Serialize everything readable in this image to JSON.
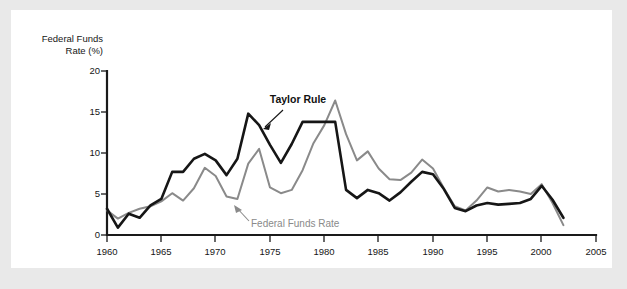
{
  "chart_data": {
    "type": "line",
    "title": "",
    "subtitle": "",
    "xlabel": "",
    "ylabel": "Federal Funds Rate (%)",
    "ylabel_line1": "Federal Funds",
    "ylabel_line2": "Rate (%)",
    "xlim": [
      1960,
      2005
    ],
    "ylim": [
      0,
      20
    ],
    "grid": false,
    "legend_position": "inline-annotations",
    "y_ticks": [
      0,
      5,
      10,
      15,
      20
    ],
    "y_tick_labels": [
      "0",
      "5",
      "10",
      "15",
      "20"
    ],
    "x_ticks": [
      1960,
      1965,
      1970,
      1975,
      1980,
      1985,
      1990,
      1995,
      2000,
      2005
    ],
    "x_tick_labels": [
      "1960",
      "1965",
      "1970",
      "1975",
      "1980",
      "1985",
      "1990",
      "1995",
      "2000",
      "2005"
    ],
    "x": [
      1960,
      1961,
      1962,
      1963,
      1964,
      1965,
      1966,
      1967,
      1968,
      1969,
      1970,
      1971,
      1972,
      1973,
      1974,
      1975,
      1976,
      1977,
      1978,
      1979,
      1980,
      1981,
      1982,
      1983,
      1984,
      1985,
      1986,
      1987,
      1988,
      1989,
      1990,
      1991,
      1992,
      1993,
      1994,
      1995,
      1996,
      1997,
      1998,
      1999,
      2000,
      2001,
      2002
    ],
    "series": [
      {
        "name": "Taylor Rule",
        "color": "#161616",
        "values": [
          3.2,
          0.9,
          2.6,
          2.1,
          3.6,
          4.4,
          7.7,
          7.7,
          9.3,
          9.9,
          9.1,
          7.3,
          9.3,
          14.8,
          13.4,
          11.0,
          8.8,
          11.1,
          13.8,
          13.8,
          13.8,
          13.8,
          5.5,
          4.5,
          5.5,
          5.1,
          4.2,
          5.2,
          6.5,
          7.7,
          7.4,
          5.6,
          3.3,
          2.9,
          3.6,
          3.9,
          3.7,
          3.8,
          3.9,
          4.4,
          6.0,
          4.3,
          2.1
        ],
        "annotation": "Taylor Rule"
      },
      {
        "name": "Federal Funds Rate",
        "color": "#8a8a8a",
        "values": [
          3.0,
          2.0,
          2.7,
          3.2,
          3.5,
          4.1,
          5.1,
          4.2,
          5.7,
          8.2,
          7.2,
          4.7,
          4.4,
          8.7,
          10.5,
          5.8,
          5.1,
          5.5,
          7.9,
          11.2,
          13.4,
          16.4,
          12.3,
          9.1,
          10.2,
          8.1,
          6.8,
          6.7,
          7.6,
          9.2,
          8.1,
          5.7,
          3.5,
          3.0,
          4.2,
          5.8,
          5.3,
          5.5,
          5.3,
          5.0,
          6.2,
          3.9,
          1.2
        ],
        "annotation": "Federal Funds Rate"
      }
    ],
    "annotations": [
      {
        "text": "Taylor Rule",
        "style": "bold",
        "color": "#111111"
      },
      {
        "text": "Federal Funds Rate",
        "style": "regular",
        "color": "#8a8a8a"
      }
    ]
  }
}
